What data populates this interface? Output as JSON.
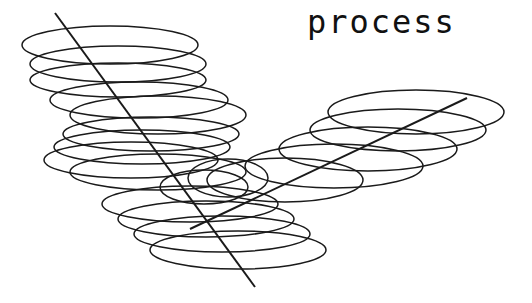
{
  "title": "process",
  "colors": {
    "stroke": "#1a1a1a",
    "background": "#ffffff",
    "text": "#111111"
  },
  "diagram": {
    "left_stack": {
      "axis": {
        "x1": 55,
        "y1": 13,
        "x2": 255,
        "y2": 287
      },
      "ellipses": [
        {
          "cx": 110,
          "cy": 45,
          "rx": 88,
          "ry": 19
        },
        {
          "cx": 118,
          "cy": 64,
          "rx": 88,
          "ry": 18
        },
        {
          "cx": 118,
          "cy": 80,
          "rx": 88,
          "ry": 17
        },
        {
          "cx": 139,
          "cy": 100,
          "rx": 89,
          "ry": 18
        },
        {
          "cx": 158,
          "cy": 115,
          "rx": 88,
          "ry": 19
        },
        {
          "cx": 151,
          "cy": 134,
          "rx": 88,
          "ry": 17
        },
        {
          "cx": 142,
          "cy": 147,
          "rx": 88,
          "ry": 17
        },
        {
          "cx": 131,
          "cy": 160,
          "rx": 87,
          "ry": 18
        },
        {
          "cx": 158,
          "cy": 172,
          "rx": 88,
          "ry": 18
        },
        {
          "cx": 190,
          "cy": 204,
          "rx": 88,
          "ry": 18
        },
        {
          "cx": 206,
          "cy": 219,
          "rx": 88,
          "ry": 18
        },
        {
          "cx": 222,
          "cy": 234,
          "rx": 88,
          "ry": 18
        },
        {
          "cx": 238,
          "cy": 250,
          "rx": 88,
          "ry": 19
        }
      ]
    },
    "right_stack": {
      "axis": {
        "x1": 467,
        "y1": 98,
        "x2": 190,
        "y2": 229
      },
      "ellipses": [
        {
          "cx": 416,
          "cy": 112,
          "rx": 88,
          "ry": 22
        },
        {
          "cx": 398,
          "cy": 130,
          "rx": 88,
          "ry": 21
        },
        {
          "cx": 368,
          "cy": 149,
          "rx": 89,
          "ry": 22
        },
        {
          "cx": 334,
          "cy": 166,
          "rx": 89,
          "ry": 22
        },
        {
          "cx": 285,
          "cy": 180,
          "rx": 78,
          "ry": 22
        },
        {
          "cx": 228,
          "cy": 178,
          "rx": 40,
          "ry": 19
        },
        {
          "cx": 204,
          "cy": 187,
          "rx": 44,
          "ry": 17
        }
      ]
    },
    "stroke_width": 1.5
  }
}
